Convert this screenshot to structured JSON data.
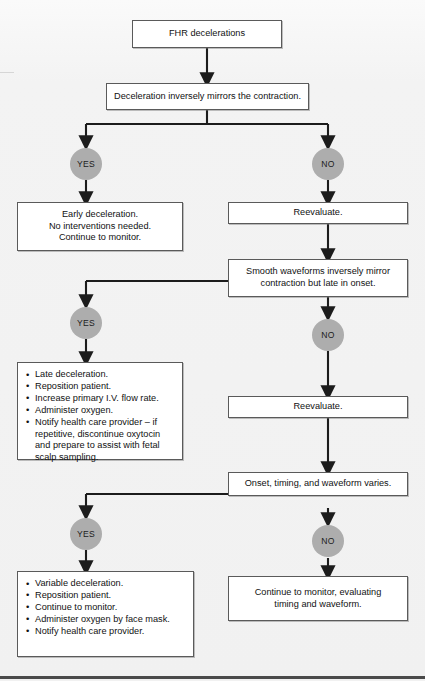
{
  "diagram": {
    "colors": {
      "node_fill": "#ffffff",
      "node_border": "#5a5a5a",
      "decision_fill": "#adadad",
      "connector": "#1c1c1c",
      "background": "#f1f1f1"
    },
    "nodes": {
      "start": {
        "label": "FHR decelerations"
      },
      "q1": {
        "label": "Deceleration inversely mirrors the contraction."
      },
      "q1_yes": {
        "label": "YES"
      },
      "q1_no": {
        "label": "NO"
      },
      "early": {
        "lines": [
          "Early deceleration.",
          "No interventions needed.",
          "Continue to monitor."
        ]
      },
      "reevaluate_1": {
        "label": "Reevaluate."
      },
      "q2": {
        "label": "Smooth waveforms inversely mirror contraction but late in onset."
      },
      "q2_yes": {
        "label": "YES"
      },
      "q2_no": {
        "label": "NO"
      },
      "late": {
        "bullets": [
          "Late deceleration.",
          "Reposition patient.",
          "Increase primary I.V. flow rate.",
          "Administer oxygen.",
          "Notify health care provider – if repetitive, discontinue oxytocin and prepare to assist with fetal scalp sampling."
        ]
      },
      "reevaluate_2": {
        "label": "Reevaluate."
      },
      "q3": {
        "label": "Onset, timing, and waveform varies."
      },
      "q3_yes": {
        "label": "YES"
      },
      "q3_no": {
        "label": "NO"
      },
      "variable": {
        "bullets": [
          "Variable deceleration.",
          "Reposition patient.",
          "Continue to monitor.",
          "Administer oxygen by face mask.",
          "Notify health care provider."
        ]
      },
      "continue_monitor": {
        "lines": [
          "Continue to monitor, evaluating",
          "timing and waveform."
        ]
      }
    }
  }
}
